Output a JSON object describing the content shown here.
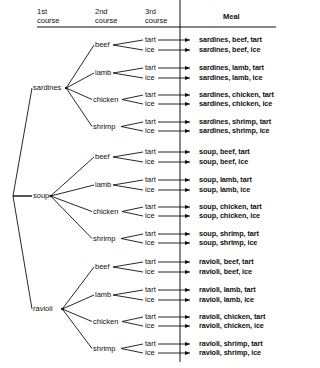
{
  "headers": {
    "first": [
      "1st",
      "course"
    ],
    "second": [
      "2nd",
      "course"
    ],
    "third": [
      "3rd",
      "course"
    ],
    "meal": "Meal"
  },
  "first_courses": [
    "sardines",
    "soup",
    "ravioli"
  ],
  "second_courses": [
    "beef",
    "lamb",
    "chicken",
    "shrimp"
  ],
  "third_courses": [
    "tart",
    "ice"
  ],
  "meals": [
    "sardines, beef, tart",
    "sardines, beef, ice",
    "sardines, lamb, tart",
    "sardines, lamb, ice",
    "sardines, chicken, tart",
    "sardines, chicken, ice",
    "sardines, shrimp, tart",
    "sardines, shrimp, ice",
    "soup, beef, tart",
    "soup, beef, ice",
    "soup, lamb, tart",
    "soup, lamb, ice",
    "soup, chicken, tart",
    "soup, chicken, ice",
    "soup, shrimp, tart",
    "soup, shrimp, ice",
    "ravioli, beef, tart",
    "ravioli, beef, ice",
    "ravioli, lamb, tart",
    "ravioli, lamb, ice",
    "ravioli, chicken, tart",
    "ravioli, chicken, ice",
    "ravioli, shrimp, tart",
    "ravioli, shrimp, ice"
  ],
  "colors": {
    "ink": "#111111",
    "background": "#ffffff"
  }
}
